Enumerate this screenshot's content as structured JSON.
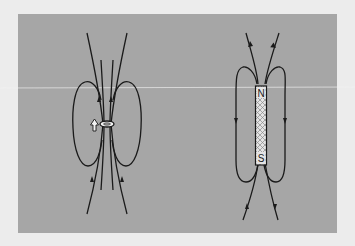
{
  "figure": {
    "background_color": "#ececec",
    "panel_color": "#a6a6a6",
    "line_color": "#1a1a1a"
  },
  "left_diagram": {
    "subject": "current loop (magnetic dipole)",
    "direction_arrow": "up-arrow"
  },
  "right_diagram": {
    "subject": "bar magnet",
    "north_label": "N",
    "south_label": "S"
  }
}
